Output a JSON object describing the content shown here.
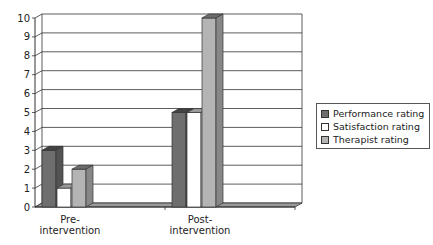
{
  "chart_data": {
    "type": "bar",
    "title": "",
    "xlabel": "",
    "ylabel": "",
    "categories": [
      "Pre-intervention",
      "Post-intervention"
    ],
    "category_labels": [
      [
        "Pre-",
        "intervention"
      ],
      [
        "Post-",
        "intervention"
      ]
    ],
    "series": [
      {
        "name": "Performance rating",
        "values": [
          3,
          5
        ],
        "color": "#6e6e6e"
      },
      {
        "name": "Satisfaction rating",
        "values": [
          1,
          5
        ],
        "color": "#ffffff"
      },
      {
        "name": "Therapist rating",
        "values": [
          2,
          10
        ],
        "color": "#b4b4b4"
      }
    ],
    "ylim": [
      0,
      10
    ],
    "yticks": [
      0,
      1,
      2,
      3,
      4,
      5,
      6,
      7,
      8,
      9,
      10
    ],
    "grid": true,
    "style": "3d-clustered-column",
    "legend_position": "right"
  },
  "legend": {
    "items": [
      {
        "label": "Performance rating",
        "color": "#6e6e6e"
      },
      {
        "label": "Satisfaction rating",
        "color": "#ffffff"
      },
      {
        "label": "Therapist rating",
        "color": "#b4b4b4"
      }
    ]
  }
}
